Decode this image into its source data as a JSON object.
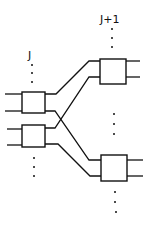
{
  "diagram": {
    "type": "network-stage-connection",
    "colors": {
      "stroke": "#111111",
      "background": "#ffffff"
    },
    "stages": [
      {
        "label": "J",
        "position": "left",
        "boxes": 2,
        "continues_above": true,
        "continues_below": true
      },
      {
        "label": "J+1",
        "position": "right",
        "boxes": 2,
        "continues_above": true,
        "continues_between": true,
        "continues_below": true
      }
    ],
    "connections": [
      {
        "from": "J.box1.out1",
        "to": "J+1.box1.in1"
      },
      {
        "from": "J.box1.out2",
        "to": "J+1.box2.in1"
      },
      {
        "from": "J.box2.out1",
        "to": "J+1.box1.in2"
      },
      {
        "from": "J.box2.out2",
        "to": "J+1.box2.in2"
      }
    ]
  },
  "labels": {
    "stage_j": "J",
    "stage_j1": "J+1"
  }
}
